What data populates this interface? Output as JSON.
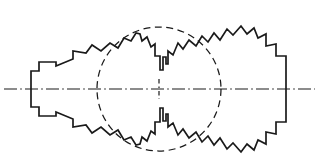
{
  "figure": {
    "type": "technical-line-drawing",
    "canvas": {
      "width": 319,
      "height": 165,
      "background": "#ffffff"
    },
    "colors": {
      "line": "#1a1a1a",
      "background": "#ffffff"
    },
    "center_axis": {
      "name": "horizontal centerline",
      "style": "dash-dot",
      "y": 89,
      "x_start": 4,
      "x_end": 315,
      "stroke_width": 1.2,
      "dash_pattern": "13 3.2 1.6 3.2",
      "path": "M 4 89 L 315 89"
    },
    "center_tick": {
      "name": "vertical center tick",
      "style": "dash-dot",
      "x": 159,
      "y_start": 79,
      "y_end": 99,
      "path": "M 159 79 L 159 99"
    },
    "detail_circle": {
      "name": "detail indication circle",
      "style": "dashed",
      "cx": 159,
      "cy": 89,
      "r": 62,
      "stroke_width": 1.25,
      "dash_pattern": "7 4.5"
    },
    "outline": {
      "name": "specimen serrated outline",
      "stroke_width": 1.7,
      "closed": true,
      "path": "M 31 89 L 31 71 L 39 71 L 39 62 L 56 62 L 56 66 L 73 59 L 73 51 L 86 53 L 92 45 L 101 51 L 110 43 L 118 48 L 124 38 L 131 41 L 136 33 L 140 34 L 142 41 L 147 37 L 151 47 L 155 44 L 155 56 L 160 56 L 160 70 L 163 70 L 163 57 L 166 57 L 166 64 L 168 64 L 168 51 L 173 55 L 178 43 L 183 49 L 189 40 L 196 46 L 202 36 L 208 42 L 214 33 L 220 40 L 227 29 L 233 35 L 241 26 L 247 34 L 254 28 L 258 38 L 266 34 L 266 46 L 276 44 L 276 56 L 286 56 L 286 71 L 286 89 L 286 107 L 286 122 L 276 122 L 276 134 L 266 132 L 266 144 L 258 140 L 254 150 L 247 144 L 241 152 L 233 143 L 227 149 L 220 138 L 214 145 L 208 136 L 202 142 L 196 132 L 189 138 L 183 129 L 178 135 L 173 123 L 168 127 L 168 114 L 166 114 L 166 121 L 163 121 L 163 108 L 160 108 L 160 122 L 155 122 L 155 134 L 151 131 L 147 141 L 142 137 L 140 144 L 136 145 L 131 137 L 124 140 L 118 130 L 110 135 L 101 127 L 92 133 L 86 125 L 73 127 L 73 119 L 56 112 L 56 116 L 39 116 L 39 107 L 31 107 Z"
    },
    "annotations": {
      "labels": [],
      "dimension_text": []
    }
  }
}
